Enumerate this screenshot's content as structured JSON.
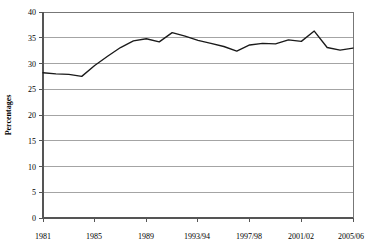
{
  "chart_data": {
    "type": "line",
    "title": "",
    "subtitle": "",
    "xlabel": "",
    "ylabel": "Percentages",
    "ylim": [
      0,
      40
    ],
    "ytick_step": 5,
    "ytick_labels": [
      "0",
      "5",
      "10",
      "15",
      "20",
      "25",
      "30",
      "35",
      "40"
    ],
    "ytick_values": [
      0,
      5,
      10,
      15,
      20,
      25,
      30,
      35,
      40
    ],
    "grid": "horizontal",
    "legend": "none",
    "legend_position": "none",
    "xtick_labels": [
      "1981",
      "1985",
      "1989",
      "1993/94",
      "1997/98",
      "2001/02",
      "2005/06"
    ],
    "xtick_values": [
      1981,
      1985,
      1989,
      1993,
      1997,
      2001,
      2005
    ],
    "xlim": [
      1981,
      2005
    ],
    "x": [
      1981,
      1982,
      1983,
      1984,
      1985,
      1986,
      1987,
      1988,
      1989,
      1990,
      1991,
      1992,
      1993,
      1994,
      1995,
      1996,
      1997,
      1998,
      1999,
      2000,
      2001,
      2002,
      2003,
      2004,
      2005
    ],
    "series": [
      {
        "name": "Percentages",
        "color": "#1a1a1a",
        "values": [
          28.2,
          28.0,
          27.9,
          27.5,
          29.6,
          31.4,
          33.1,
          34.4,
          34.8,
          34.2,
          36.0,
          35.3,
          34.5,
          33.9,
          33.3,
          32.4,
          33.6,
          33.9,
          33.8,
          34.6,
          34.3,
          36.3,
          33.1,
          32.6,
          33.0
        ]
      }
    ]
  },
  "axis": {
    "y_title": "Percentages"
  },
  "colors": {
    "series": "#1a1a1a",
    "gridline": "#9a9a9a",
    "axis": "#555555",
    "frame": "#777777",
    "background": "#ffffff"
  }
}
